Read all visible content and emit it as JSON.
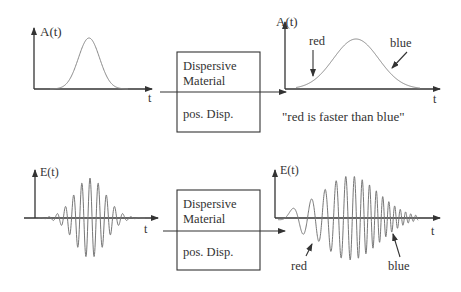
{
  "panels": {
    "top_left": {
      "ylabel": "A(t)",
      "xlabel": "t"
    },
    "top_box": {
      "line1": "Dispersive",
      "line2": "Material",
      "line3": "pos. Disp."
    },
    "top_right": {
      "ylabel": "A(t)",
      "xlabel": "t",
      "red_label": "red",
      "blue_label": "blue",
      "caption": "\"red is faster than blue\""
    },
    "bottom_left": {
      "ylabel": "E(t)",
      "xlabel": "t"
    },
    "bottom_box": {
      "line1": "Dispersive",
      "line2": "Material",
      "line3": "pos. Disp."
    },
    "bottom_right": {
      "ylabel": "E(t)",
      "xlabel": "t",
      "red_label": "red",
      "blue_label": "blue"
    }
  },
  "colors": {
    "axis": "#333333",
    "curve": "#888888"
  }
}
